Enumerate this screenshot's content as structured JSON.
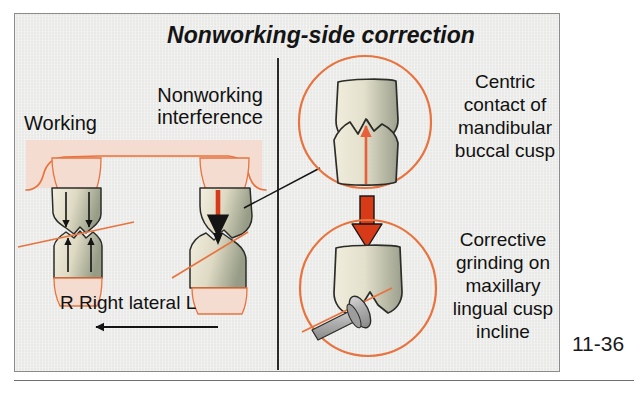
{
  "figure": {
    "title": "Nonworking-side correction",
    "number": "11-36"
  },
  "left_panel": {
    "working_label": "Working",
    "nonworking_label": "Nonworking interference",
    "movement_label": "R  Right lateral  L",
    "movement_direction": "left",
    "right_marker": "R",
    "left_marker": "L"
  },
  "right_panel": {
    "top_caption": "Centric contact of mandibular buccal cusp",
    "bottom_caption": "Corrective grinding on maxillary lingual cusp incline"
  },
  "colors": {
    "panel_background": "#e9e9e7",
    "panel_border": "#8b8b8b",
    "gingiva_fill": "#f5dcd0",
    "outline_orange": "#e8733f",
    "arrow_red": "#d63a16",
    "arrow_salmon": "#e8603a",
    "arrow_black": "#141414",
    "tooth_light": "#eeeadb",
    "tooth_shadow": "#9aa08c",
    "tooth_outline": "#2c2c28",
    "bur_metal": "#b4b4b4",
    "text": "#111111"
  }
}
